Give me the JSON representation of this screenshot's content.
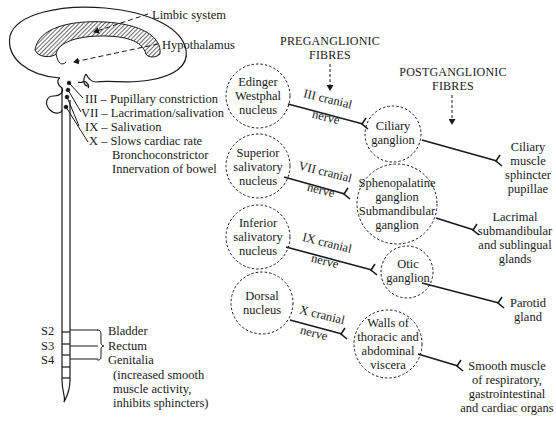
{
  "brain": {
    "limbic_label": "Limbic system",
    "hypothalamus_label": "Hypothalamus"
  },
  "cranial_outflow": [
    {
      "nerve": "III",
      "label": "III – Pupillary constriction"
    },
    {
      "nerve": "VII",
      "label": "VII – Lacrimation/salivation"
    },
    {
      "nerve": "IX",
      "label": "IX – Salivation"
    },
    {
      "nerve": "X",
      "label": "X – Slows cardiac rate"
    }
  ],
  "vagus_extra": [
    "Bronchoconstrictor",
    "Innervation of bowel"
  ],
  "sacral": {
    "segments": [
      "S2",
      "S3",
      "S4"
    ],
    "targets": [
      "Bladder",
      "Rectum",
      "Genitalia"
    ],
    "note": [
      "(increased smooth",
      "muscle activity,",
      "inhibits sphincters)"
    ]
  },
  "headers": {
    "pre": [
      "PREGANGLIONIC",
      "FIBRES"
    ],
    "post": [
      "POSTGANGLIONIC",
      "FIBRES"
    ]
  },
  "pathways": [
    {
      "nucleus": [
        "Edinger",
        "Westphal",
        "nucleus"
      ],
      "nerve": [
        "III cranial",
        "nerve"
      ],
      "ganglion": [
        "Ciliary",
        "ganglion"
      ],
      "target": [
        "Ciliary",
        "muscle",
        "sphincter",
        "pupillae"
      ]
    },
    {
      "nucleus": [
        "Superior",
        "salivatory",
        "nucleus"
      ],
      "nerve": [
        "VII cranial",
        "nerve"
      ],
      "ganglion": [
        "Sphenopalatine",
        "ganglion",
        "Submandibular",
        "ganglion"
      ],
      "target": [
        "Lacrimal",
        "submandibular",
        "and sublingual",
        "glands"
      ]
    },
    {
      "nucleus": [
        "Inferior",
        "salivatory",
        "nucleus"
      ],
      "nerve": [
        "IX cranial",
        "nerve"
      ],
      "ganglion": [
        "Otic",
        "ganglion"
      ],
      "target": [
        "Parotid",
        "gland"
      ]
    },
    {
      "nucleus": [
        "Dorsal",
        "nucleus"
      ],
      "nerve": [
        "X cranial",
        "nerve"
      ],
      "ganglion": [
        "Walls of",
        "thoracic and",
        "abdominal",
        "viscera"
      ],
      "target": [
        "Smooth muscle",
        "of respiratory,",
        "gastrointestinal",
        "and cardiac organs"
      ]
    }
  ],
  "colors": {
    "ink": "#1a1a1a",
    "background": "#ffffff"
  }
}
